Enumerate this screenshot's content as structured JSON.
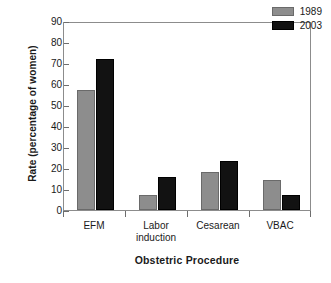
{
  "chart_data": {
    "type": "bar",
    "title": "",
    "xlabel": "Obstetric Procedure",
    "ylabel": "Rate (percentage of women)",
    "categories": [
      "EFM",
      "Labor\ninduction",
      "Cesarean",
      "VBAC"
    ],
    "series": [
      {
        "name": "1989",
        "color": "#8d8d8d",
        "values": [
          57,
          7,
          18,
          14.5
        ]
      },
      {
        "name": "2003",
        "color": "#121212",
        "values": [
          72,
          15.5,
          23.5,
          7
        ]
      }
    ],
    "ylim": [
      0,
      90
    ],
    "ytick_labels": [
      "0",
      "10",
      "20",
      "30",
      "40",
      "50",
      "60",
      "70",
      "80",
      "90"
    ],
    "ytick_values": [
      0,
      10,
      20,
      30,
      40,
      50,
      60,
      70,
      80,
      90
    ],
    "grid": false,
    "legend_position": "top-right"
  }
}
